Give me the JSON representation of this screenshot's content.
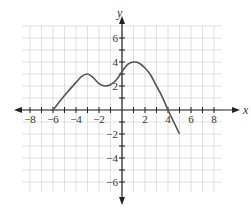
{
  "chart_data": {
    "type": "line",
    "title": "",
    "xlabel": "x",
    "ylabel": "y",
    "xlim": [
      -8.7,
      8.7
    ],
    "ylim": [
      -7,
      7
    ],
    "grid": true,
    "x_ticks": [
      -8,
      -6,
      -4,
      -2,
      2,
      4,
      6,
      8
    ],
    "y_ticks": [
      -6,
      -4,
      -2,
      2,
      4,
      6
    ],
    "x_tick_labels": [
      "−8",
      "−6",
      "−4",
      "−2",
      "2",
      "4",
      "6",
      "8"
    ],
    "y_tick_labels": [
      "−6",
      "−4",
      "−2",
      "2",
      "4",
      "6"
    ],
    "series": [
      {
        "name": "f(x)",
        "color": "#555555",
        "points": [
          [
            -6,
            0
          ],
          [
            -5,
            1.2
          ],
          [
            -4,
            2.3
          ],
          [
            -3.5,
            2.8
          ],
          [
            -3,
            3.0
          ],
          [
            -2.5,
            2.7
          ],
          [
            -2,
            2.2
          ],
          [
            -1.5,
            2.0
          ],
          [
            -1,
            2.1
          ],
          [
            -0.5,
            2.5
          ],
          [
            0,
            3.2
          ],
          [
            0.5,
            3.8
          ],
          [
            1,
            4.0
          ],
          [
            1.5,
            3.9
          ],
          [
            2,
            3.5
          ],
          [
            2.5,
            2.9
          ],
          [
            3,
            2.0
          ],
          [
            3.5,
            1.1
          ],
          [
            4,
            0
          ],
          [
            4.5,
            -1.0
          ],
          [
            5,
            -2.0
          ]
        ]
      }
    ],
    "annotations": []
  },
  "colors": {
    "grid": "#d8d8d8",
    "axis": "#222222",
    "curve": "#555555"
  }
}
